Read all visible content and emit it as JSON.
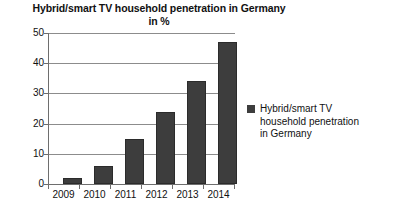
{
  "chart_data": {
    "type": "bar",
    "title": "Hybrid/smart TV household penetration in Germany in %",
    "title_line1": "Hybrid/smart TV household penetration in Germany",
    "title_line2": "in %",
    "categories": [
      "2009",
      "2010",
      "2011",
      "2012",
      "2013",
      "2014"
    ],
    "values": [
      2,
      6,
      15,
      24,
      34,
      47
    ],
    "series": [
      {
        "name": "Hybrid/smart TV household penetration in Germany",
        "values": [
          2,
          6,
          15,
          24,
          34,
          47
        ]
      }
    ],
    "xlabel": "",
    "ylabel": "",
    "ylim": [
      0,
      50
    ],
    "ytick_labels": [
      "0",
      "10",
      "20",
      "30",
      "40",
      "50"
    ],
    "ytick_values": [
      0,
      10,
      20,
      30,
      40,
      50
    ],
    "grid": true,
    "legend_position": "right",
    "legend": [
      {
        "label": "Hybrid/smart TV household penetration in Germany",
        "label_line1": "Hybrid/smart TV",
        "label_line2": "household penetration",
        "label_line3": "in Germany",
        "color": "#3d3d3d"
      }
    ],
    "colors": {
      "bar": "#3d3d3d",
      "bar_border": "#2b2b2b",
      "gridline": "#8c8c8c",
      "axis": "#6e6e6e",
      "text": "#111111",
      "background": "#ffffff"
    }
  }
}
